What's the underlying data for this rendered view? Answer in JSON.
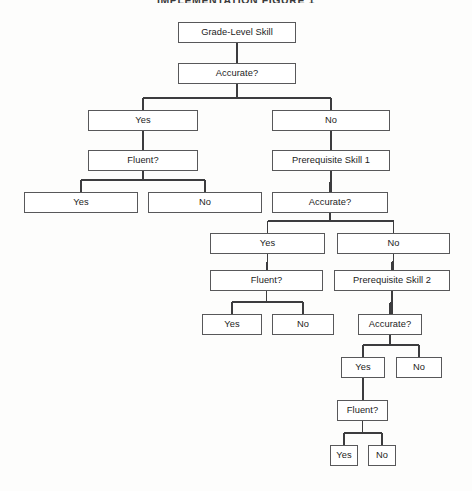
{
  "title": "IMPLEMENTATION FIGURE 1",
  "diagram": {
    "type": "flowchart",
    "orientation": "top-down",
    "background_color": "#fdfdfc",
    "box_fill_color": "#ffffff",
    "box_border_color": "#58585a",
    "connector_color": "#3c3c3e",
    "nodes": [
      {
        "id": "n1",
        "label": "Grade-Level Skill",
        "x": 178,
        "y": 22,
        "w": 118,
        "h": 21
      },
      {
        "id": "n2",
        "label": "Accurate?",
        "x": 178,
        "y": 63,
        "w": 118,
        "h": 21
      },
      {
        "id": "n3",
        "label": "Yes",
        "x": 88,
        "y": 110,
        "w": 110,
        "h": 21
      },
      {
        "id": "n4",
        "label": "No",
        "x": 272,
        "y": 110,
        "w": 118,
        "h": 21
      },
      {
        "id": "n5",
        "label": "Fluent?",
        "x": 88,
        "y": 150,
        "w": 110,
        "h": 21
      },
      {
        "id": "n6",
        "label": "Prerequisite Skill 1",
        "x": 272,
        "y": 150,
        "w": 118,
        "h": 21
      },
      {
        "id": "n7",
        "label": "Yes",
        "x": 24,
        "y": 192,
        "w": 114,
        "h": 21
      },
      {
        "id": "n8",
        "label": "No",
        "x": 148,
        "y": 192,
        "w": 114,
        "h": 21
      },
      {
        "id": "n9",
        "label": "Accurate?",
        "x": 272,
        "y": 192,
        "w": 116,
        "h": 21
      },
      {
        "id": "n10",
        "label": "Yes",
        "x": 210,
        "y": 233,
        "w": 115,
        "h": 21
      },
      {
        "id": "n11",
        "label": "No",
        "x": 337,
        "y": 233,
        "w": 113,
        "h": 21
      },
      {
        "id": "n12",
        "label": "Fluent?",
        "x": 210,
        "y": 270,
        "w": 113,
        "h": 21
      },
      {
        "id": "n13",
        "label": "Prerequisite Skill 2",
        "x": 334,
        "y": 270,
        "w": 116,
        "h": 21
      },
      {
        "id": "n14",
        "label": "Yes",
        "x": 202,
        "y": 314,
        "w": 60,
        "h": 21
      },
      {
        "id": "n15",
        "label": "No",
        "x": 272,
        "y": 314,
        "w": 62,
        "h": 21
      },
      {
        "id": "n16",
        "label": "Accurate?",
        "x": 358,
        "y": 314,
        "w": 64,
        "h": 21
      },
      {
        "id": "n17",
        "label": "Yes",
        "x": 341,
        "y": 357,
        "w": 44,
        "h": 21
      },
      {
        "id": "n18",
        "label": "No",
        "x": 396,
        "y": 357,
        "w": 46,
        "h": 21
      },
      {
        "id": "n19",
        "label": "Fluent?",
        "x": 337,
        "y": 400,
        "w": 51,
        "h": 21
      },
      {
        "id": "n20",
        "label": "Yes",
        "x": 330,
        "y": 445,
        "w": 28,
        "h": 21
      },
      {
        "id": "n21",
        "label": "No",
        "x": 368,
        "y": 445,
        "w": 28,
        "h": 21
      }
    ],
    "edges": [
      {
        "from": "n1",
        "to": "n2",
        "kind": "straight"
      },
      {
        "from": "n2",
        "to": "n3",
        "kind": "branch",
        "branch_label": "Yes"
      },
      {
        "from": "n2",
        "to": "n4",
        "kind": "branch",
        "branch_label": "No"
      },
      {
        "from": "n3",
        "to": "n5",
        "kind": "straight"
      },
      {
        "from": "n4",
        "to": "n6",
        "kind": "straight"
      },
      {
        "from": "n5",
        "to": "n7",
        "kind": "branch",
        "branch_label": "Yes"
      },
      {
        "from": "n5",
        "to": "n8",
        "kind": "branch",
        "branch_label": "No"
      },
      {
        "from": "n6",
        "to": "n9",
        "kind": "straight"
      },
      {
        "from": "n9",
        "to": "n10",
        "kind": "branch",
        "branch_label": "Yes"
      },
      {
        "from": "n9",
        "to": "n11",
        "kind": "branch",
        "branch_label": "No"
      },
      {
        "from": "n10",
        "to": "n12",
        "kind": "straight"
      },
      {
        "from": "n11",
        "to": "n13",
        "kind": "straight"
      },
      {
        "from": "n12",
        "to": "n14",
        "kind": "branch",
        "branch_label": "Yes"
      },
      {
        "from": "n12",
        "to": "n15",
        "kind": "branch",
        "branch_label": "No"
      },
      {
        "from": "n13",
        "to": "n16",
        "kind": "straight"
      },
      {
        "from": "n16",
        "to": "n17",
        "kind": "branch",
        "branch_label": "Yes"
      },
      {
        "from": "n16",
        "to": "n18",
        "kind": "branch",
        "branch_label": "No"
      },
      {
        "from": "n17",
        "to": "n19",
        "kind": "straight"
      },
      {
        "from": "n19",
        "to": "n20",
        "kind": "branch",
        "branch_label": "Yes"
      },
      {
        "from": "n19",
        "to": "n21",
        "kind": "branch",
        "branch_label": "No"
      }
    ]
  }
}
